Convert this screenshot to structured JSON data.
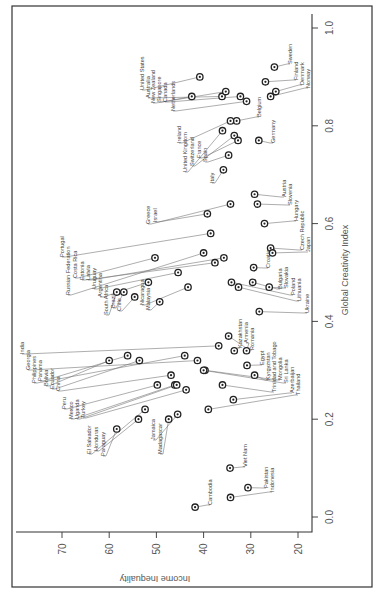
{
  "chart_data": {
    "type": "scatter",
    "orientation_note": "figure rotated 90deg counterclockwise on page",
    "title": "",
    "xlabel": "Global Creativity Index",
    "ylabel": "Income Inequality",
    "xlim": [
      -0.03,
      1.03
    ],
    "ylim": [
      17,
      78
    ],
    "x_ticks": [
      "0.0",
      "0.2",
      "0.4",
      "0.6",
      "0.8",
      "1.0"
    ],
    "y_ticks": [
      "70",
      "60",
      "50",
      "40",
      "30",
      "20"
    ],
    "grid": false,
    "points": [
      {
        "country": "United States",
        "gci": 0.9,
        "ineq": 40.8,
        "lx": 142,
        "ly": 90
      },
      {
        "country": "Australia",
        "gci": 0.86,
        "ineq": 36.1,
        "lx": 148,
        "ly": 98
      },
      {
        "country": "New Zealand",
        "gci": 0.87,
        "ineq": 35.3,
        "lx": 153,
        "ly": 103
      },
      {
        "country": "Singapore",
        "gci": 0.86,
        "ineq": 42.5,
        "lx": 159,
        "ly": 102
      },
      {
        "country": "Canada",
        "gci": 0.86,
        "ineq": 32.2,
        "lx": 165,
        "ly": 102
      },
      {
        "country": "Netherlands",
        "gci": 0.85,
        "ineq": 30.9,
        "lx": 173,
        "ly": 111
      },
      {
        "country": "Belgium",
        "gci": 0.81,
        "ineq": 33.0,
        "lx": 259,
        "ly": 117
      },
      {
        "country": "Ireland",
        "gci": 0.81,
        "ineq": 34.3,
        "lx": 179,
        "ly": 143
      },
      {
        "country": "United Kingdom",
        "gci": 0.79,
        "ineq": 36.0,
        "lx": 185,
        "ly": 172
      },
      {
        "country": "Switzerland",
        "gci": 0.78,
        "ineq": 33.5,
        "lx": 192,
        "ly": 166
      },
      {
        "country": "France",
        "gci": 0.77,
        "ineq": 32.7,
        "lx": 199,
        "ly": 158
      },
      {
        "country": "Spain",
        "gci": 0.74,
        "ineq": 34.7,
        "lx": 205,
        "ly": 162
      },
      {
        "country": "Italy",
        "gci": 0.71,
        "ineq": 35.8,
        "lx": 212,
        "ly": 183
      },
      {
        "country": "Germany",
        "gci": 0.77,
        "ineq": 28.3,
        "lx": 273,
        "ly": 143
      },
      {
        "country": "Sweden",
        "gci": 0.92,
        "ineq": 25.0,
        "lx": 290,
        "ly": 64
      },
      {
        "country": "Finland",
        "gci": 0.89,
        "ineq": 26.9,
        "lx": 296,
        "ly": 80
      },
      {
        "country": "Denmark",
        "gci": 0.87,
        "ineq": 24.7,
        "lx": 302,
        "ly": 85
      },
      {
        "country": "Norway",
        "gci": 0.86,
        "ineq": 25.8,
        "lx": 308,
        "ly": 88
      },
      {
        "country": "Austria",
        "gci": 0.66,
        "ineq": 29.2,
        "lx": 284,
        "ly": 197
      },
      {
        "country": "Slovenia",
        "gci": 0.64,
        "ineq": 28.6,
        "lx": 290,
        "ly": 205
      },
      {
        "country": "Hungary",
        "gci": 0.6,
        "ineq": 27.1,
        "lx": 296,
        "ly": 221
      },
      {
        "country": "Czech Republic",
        "gci": 0.55,
        "ineq": 25.8,
        "lx": 302,
        "ly": 250
      },
      {
        "country": "Japan",
        "gci": 0.54,
        "ineq": 25.4,
        "lx": 308,
        "ly": 252
      },
      {
        "country": "Croatia",
        "gci": 0.51,
        "ineq": 29.4,
        "lx": 268,
        "ly": 268
      },
      {
        "country": "Bulgaria",
        "gci": 0.48,
        "ineq": 29.6,
        "lx": 280,
        "ly": 289
      },
      {
        "country": "Slovakia",
        "gci": 0.47,
        "ineq": 26.1,
        "lx": 286,
        "ly": 288
      },
      {
        "country": "Poland",
        "gci": 0.48,
        "ineq": 34.1,
        "lx": 293,
        "ly": 295
      },
      {
        "country": "Lithuania",
        "gci": 0.47,
        "ineq": 32.6,
        "lx": 299,
        "ly": 301
      },
      {
        "country": "Ukraine",
        "gci": 0.42,
        "ineq": 28.2,
        "lx": 307,
        "ly": 313
      },
      {
        "country": "Greece",
        "gci": 0.64,
        "ineq": 34.3,
        "lx": 148,
        "ly": 224
      },
      {
        "country": "Israel",
        "gci": 0.62,
        "ineq": 39.2,
        "lx": 155,
        "ly": 222
      },
      {
        "country": "Portugal",
        "gci": 0.58,
        "ineq": 38.5,
        "lx": 62,
        "ly": 257
      },
      {
        "country": "Russian Federation",
        "gci": 0.54,
        "ineq": 40.0,
        "lx": 68,
        "ly": 295
      },
      {
        "country": "Costa Rica",
        "gci": 0.53,
        "ineq": 50.3,
        "lx": 75,
        "ly": 278
      },
      {
        "country": "Estonia",
        "gci": 0.52,
        "ineq": 37.6,
        "lx": 82,
        "ly": 280
      },
      {
        "country": "Latvia",
        "gci": 0.53,
        "ineq": 35.7,
        "lx": 88,
        "ly": 280
      },
      {
        "country": "Uruguay",
        "gci": 0.5,
        "ineq": 45.4,
        "lx": 94,
        "ly": 289
      },
      {
        "country": "Argentina",
        "gci": 0.48,
        "ineq": 51.7,
        "lx": 100,
        "ly": 297
      },
      {
        "country": "South Africa",
        "gci": 0.46,
        "ineq": 58.4,
        "lx": 106,
        "ly": 315
      },
      {
        "country": "Brazil",
        "gci": 0.46,
        "ineq": 56.9,
        "lx": 113,
        "ly": 308
      },
      {
        "country": "Chile",
        "gci": 0.45,
        "ineq": 54.6,
        "lx": 119,
        "ly": 311
      },
      {
        "country": "Nicaragua",
        "gci": 0.47,
        "ineq": 43.3,
        "lx": 142,
        "ly": 305
      },
      {
        "country": "Malaysia",
        "gci": 0.44,
        "ineq": 49.3,
        "lx": 148,
        "ly": 310
      },
      {
        "country": "Kazakhstan",
        "gci": 0.34,
        "ineq": 33.5,
        "lx": 240,
        "ly": 348
      },
      {
        "country": "Armenia",
        "gci": 0.34,
        "ineq": 30.9,
        "lx": 246,
        "ly": 343
      },
      {
        "country": "Romania",
        "gci": 0.37,
        "ineq": 34.7,
        "lx": 252,
        "ly": 350
      },
      {
        "country": "Egypt",
        "gci": 0.31,
        "ineq": 30.8,
        "lx": 262,
        "ly": 365
      },
      {
        "country": "Kyrgyzstan",
        "gci": 0.29,
        "ineq": 29.2,
        "lx": 268,
        "ly": 380
      },
      {
        "country": "Trinidad and Tobago",
        "gci": 0.27,
        "ineq": 36.0,
        "lx": 274,
        "ly": 392
      },
      {
        "country": "Mongolia",
        "gci": 0.3,
        "ineq": 39.7,
        "lx": 280,
        "ly": 380
      },
      {
        "country": "Sri Lanka",
        "gci": 0.3,
        "ineq": 40.0,
        "lx": 286,
        "ly": 383
      },
      {
        "country": "Azerbaijan",
        "gci": 0.24,
        "ineq": 33.7,
        "lx": 292,
        "ly": 393
      },
      {
        "country": "Thailand",
        "gci": 0.22,
        "ineq": 39.0,
        "lx": 298,
        "ly": 395
      },
      {
        "country": "India",
        "gci": 0.35,
        "ineq": 36.8,
        "lx": 22,
        "ly": 354
      },
      {
        "country": "Georgia",
        "gci": 0.32,
        "ineq": 41.3,
        "lx": 28,
        "ly": 370
      },
      {
        "country": "Philippines",
        "gci": 0.33,
        "ineq": 44.0,
        "lx": 34,
        "ly": 383
      },
      {
        "country": "Panama",
        "gci": 0.33,
        "ineq": 56.1,
        "lx": 40,
        "ly": 381
      },
      {
        "country": "Bolivia",
        "gci": 0.32,
        "ineq": 60.0,
        "lx": 46,
        "ly": 386
      },
      {
        "country": "Ecuador",
        "gci": 0.32,
        "ineq": 53.6,
        "lx": 52,
        "ly": 389
      },
      {
        "country": "China",
        "gci": 0.29,
        "ineq": 46.9,
        "lx": 58,
        "ly": 391
      },
      {
        "country": "Peru",
        "gci": 0.27,
        "ineq": 49.8,
        "lx": 64,
        "ly": 409
      },
      {
        "country": "Mexico",
        "gci": 0.27,
        "ineq": 46.1,
        "lx": 71,
        "ly": 419
      },
      {
        "country": "Uganda",
        "gci": 0.27,
        "ineq": 45.7,
        "lx": 77,
        "ly": 419
      },
      {
        "country": "Turkey",
        "gci": 0.26,
        "ineq": 43.7,
        "lx": 83,
        "ly": 418
      },
      {
        "country": "El Salvador",
        "gci": 0.22,
        "ineq": 52.4,
        "lx": 89,
        "ly": 454
      },
      {
        "country": "Honduras",
        "gci": 0.2,
        "ineq": 53.8,
        "lx": 96,
        "ly": 451
      },
      {
        "country": "Paraguay",
        "gci": 0.18,
        "ineq": 58.4,
        "lx": 103,
        "ly": 456
      },
      {
        "country": "Jamaica",
        "gci": 0.21,
        "ineq": 45.5,
        "lx": 153,
        "ly": 440
      },
      {
        "country": "Madagascar",
        "gci": 0.2,
        "ineq": 47.4,
        "lx": 160,
        "ly": 454
      },
      {
        "country": "Viet Nam",
        "gci": 0.1,
        "ineq": 34.4,
        "lx": 245,
        "ly": 467
      },
      {
        "country": "Pakistan",
        "gci": 0.06,
        "ineq": 30.6,
        "lx": 266,
        "ly": 488
      },
      {
        "country": "Indonesia",
        "gci": 0.04,
        "ineq": 34.3,
        "lx": 272,
        "ly": 492
      },
      {
        "country": "Cambodia",
        "gci": 0.02,
        "ineq": 41.8,
        "lx": 210,
        "ly": 505
      }
    ]
  },
  "axes": {
    "gci_label": "Global Creativity Index",
    "ineq_label": "Income Inequality",
    "gci_ticks": [
      {
        "label": "0.0",
        "v": 0.0
      },
      {
        "label": "0.2",
        "v": 0.2
      },
      {
        "label": "0.4",
        "v": 0.4
      },
      {
        "label": "0.6",
        "v": 0.6
      },
      {
        "label": "0.8",
        "v": 0.8
      },
      {
        "label": "1.0",
        "v": 1.0
      }
    ],
    "ineq_ticks": [
      {
        "label": "70",
        "v": 70
      },
      {
        "label": "60",
        "v": 60
      },
      {
        "label": "50",
        "v": 50
      },
      {
        "label": "40",
        "v": 40
      },
      {
        "label": "30",
        "v": 30
      },
      {
        "label": "20",
        "v": 20
      }
    ]
  },
  "colors": {
    "ink": "#222222",
    "text": "#555555",
    "leader": "#777777",
    "background": "#ffffff"
  }
}
